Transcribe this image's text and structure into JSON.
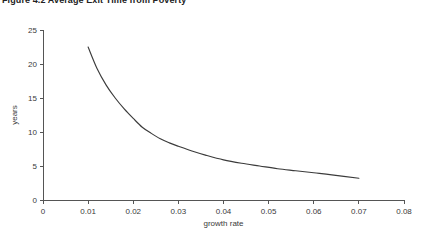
{
  "figure": {
    "title": "Figure 4.2 Average Exit Time from Poverty"
  },
  "chart_data": {
    "type": "line",
    "title": "Figure 4.2 Average Exit Time from Poverty",
    "xlabel": "growth rate",
    "ylabel": "years",
    "xlim": [
      0,
      0.08
    ],
    "ylim": [
      0,
      25
    ],
    "grid": false,
    "legend": null,
    "xticks": [
      0,
      0.01,
      0.02,
      0.03,
      0.04,
      0.05,
      0.06,
      0.07,
      0.08
    ],
    "xtick_labels": [
      "0",
      "0.01",
      "0.02",
      "0.03",
      "0.04",
      "0.05",
      "0.06",
      "0.07",
      "0.08"
    ],
    "yticks": [
      0,
      5,
      10,
      15,
      20,
      25
    ],
    "ytick_labels": [
      "0",
      "5",
      "10",
      "15",
      "20",
      "25"
    ],
    "series": [
      {
        "name": "average exit time",
        "color": "#3b3b3b",
        "x": [
          0.01,
          0.012,
          0.014,
          0.016,
          0.018,
          0.02,
          0.022,
          0.024,
          0.026,
          0.028,
          0.03,
          0.033,
          0.036,
          0.04,
          0.044,
          0.048,
          0.052,
          0.056,
          0.06,
          0.064,
          0.07
        ],
        "y": [
          22.5,
          19.3,
          16.9,
          15.0,
          13.4,
          12.0,
          10.7,
          9.8,
          9.0,
          8.4,
          7.9,
          7.2,
          6.6,
          5.9,
          5.4,
          5.0,
          4.6,
          4.3,
          4.0,
          3.7,
          3.2
        ]
      }
    ]
  },
  "axes": {
    "x_axis_name": "growth-rate-axis",
    "y_axis_name": "years-axis"
  }
}
